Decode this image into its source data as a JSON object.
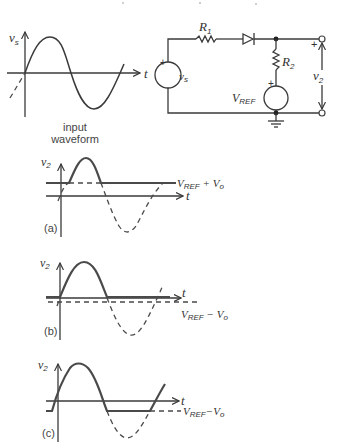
{
  "top_caption_fragment": "",
  "input_waveform": {
    "caption_line1": "input",
    "caption_line2": "waveform",
    "y_axis_label": "v",
    "y_axis_sub": "s",
    "x_axis_label": "t"
  },
  "circuit": {
    "r1_label": "R",
    "r1_sub": "1",
    "r2_label": "R",
    "r2_sub": "2",
    "source_label": "v",
    "source_sub": "s",
    "vref_label": "V",
    "vref_sub": "REF",
    "output_label": "v",
    "output_sub": "2",
    "plus_sign": "+",
    "minus_sign": "−"
  },
  "panels": [
    {
      "id": "a",
      "tag": "(a)",
      "y_axis_label": "v",
      "y_axis_sub": "2",
      "x_axis_label": "t",
      "level_label": "V",
      "level_sub": "REF",
      "level_suffix": " + V",
      "level_suffix_sub": "o"
    },
    {
      "id": "b",
      "tag": "(b)",
      "y_axis_label": "v",
      "y_axis_sub": "2",
      "x_axis_label": "t",
      "level_label": "V",
      "level_sub": "REF",
      "level_suffix": " − V",
      "level_suffix_sub": "o"
    },
    {
      "id": "c",
      "tag": "(c)",
      "y_axis_label": "v",
      "y_axis_sub": "2",
      "x_axis_label": "t",
      "level_label": "V",
      "level_sub": "REF",
      "level_suffix": "−V",
      "level_suffix_sub": "o"
    }
  ]
}
